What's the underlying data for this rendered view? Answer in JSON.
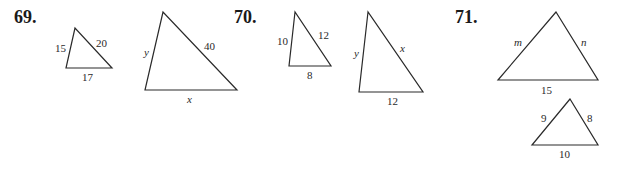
{
  "problems": [
    {
      "number": "69.",
      "triangles": [
        {
          "id": "69-small",
          "vertices": [
            [
              75,
              28
            ],
            [
              66,
              68
            ],
            [
              112,
              68
            ]
          ],
          "labels": [
            {
              "text": "15",
              "side": "left",
              "italic": false
            },
            {
              "text": "20",
              "side": "right",
              "italic": false
            },
            {
              "text": "17",
              "side": "bottom",
              "italic": false
            }
          ]
        },
        {
          "id": "69-large",
          "vertices": [
            [
              163,
              12
            ],
            [
              145,
              90
            ],
            [
              237,
              90
            ]
          ],
          "labels": [
            {
              "text": "y",
              "side": "left",
              "italic": true
            },
            {
              "text": "40",
              "side": "right",
              "italic": false
            },
            {
              "text": "x",
              "side": "bottom",
              "italic": true
            }
          ]
        }
      ]
    },
    {
      "number": "70.",
      "triangles": [
        {
          "id": "70-small",
          "vertices": [
            [
              295,
              12
            ],
            [
              289,
              66
            ],
            [
              331,
              66
            ]
          ],
          "labels": [
            {
              "text": "10",
              "side": "left",
              "italic": false
            },
            {
              "text": "12",
              "side": "right",
              "italic": false
            },
            {
              "text": "8",
              "side": "bottom",
              "italic": false
            }
          ]
        },
        {
          "id": "70-large",
          "vertices": [
            [
              368,
              12
            ],
            [
              359,
              92
            ],
            [
              423,
              92
            ]
          ],
          "labels": [
            {
              "text": "y",
              "side": "left",
              "italic": true
            },
            {
              "text": "x",
              "side": "right",
              "italic": true
            },
            {
              "text": "12",
              "side": "bottom",
              "italic": false
            }
          ]
        }
      ]
    },
    {
      "number": "71.",
      "triangles": [
        {
          "id": "71-large",
          "vertices": [
            [
              556,
              12
            ],
            [
              498,
              80
            ],
            [
              598,
              80
            ]
          ],
          "labels": [
            {
              "text": "m",
              "side": "left",
              "italic": true
            },
            {
              "text": "n",
              "side": "right",
              "italic": true
            },
            {
              "text": "15",
              "side": "bottom",
              "italic": false
            }
          ]
        },
        {
          "id": "71-small",
          "vertices": [
            [
              570,
              99
            ],
            [
              532,
              145
            ],
            [
              598,
              145
            ]
          ],
          "labels": [
            {
              "text": "9",
              "side": "left",
              "italic": false
            },
            {
              "text": "8",
              "side": "right",
              "italic": false
            },
            {
              "text": "10",
              "side": "bottom",
              "italic": false
            }
          ]
        }
      ]
    }
  ]
}
